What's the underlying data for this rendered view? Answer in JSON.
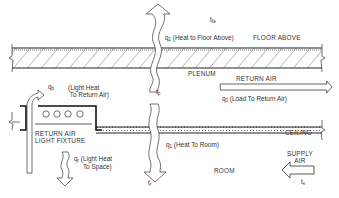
{
  "diagram": {
    "type": "ceiling plenum heat flow schematic",
    "labels": {
      "t_fa": "t",
      "t_fa_sub": "fa",
      "q2_label": "q",
      "q2_sub": "2",
      "q2_text": "(Heat to Floor Above)",
      "floor_above": "FLOOR ABOVE",
      "plenum": "PLENUM",
      "return_air": "RETURN AIR",
      "q3_label": "q",
      "q3_sub": "3",
      "q3_text": "(Load To Return Air)",
      "qb_label": "q",
      "qb_sub": "b",
      "qb_text_line1": "(Light Heat",
      "qb_text_line2": "To Return Air)",
      "tp": "t",
      "tp_sub": "p",
      "ceiling": "CEILING",
      "fixture_line1": "RETURN AIR",
      "fixture_line2": "LIGHT FIXTURE",
      "q1_label": "q",
      "q1_sub": "1",
      "q1_text": "(Heat To Room)",
      "qr_label": "q",
      "qr_sub": "r",
      "qr_text_line1": "(Light Heat",
      "qr_text_line2": "To Space)",
      "tr": "t",
      "tr_sub": "r",
      "room": "ROOM",
      "supply_line1": "SUPPLY",
      "supply_line2": "AIR",
      "ts": "t",
      "ts_sub": "s"
    },
    "colors": {
      "line": "#222222",
      "hatch": "#444444",
      "dots": "#555555"
    }
  }
}
